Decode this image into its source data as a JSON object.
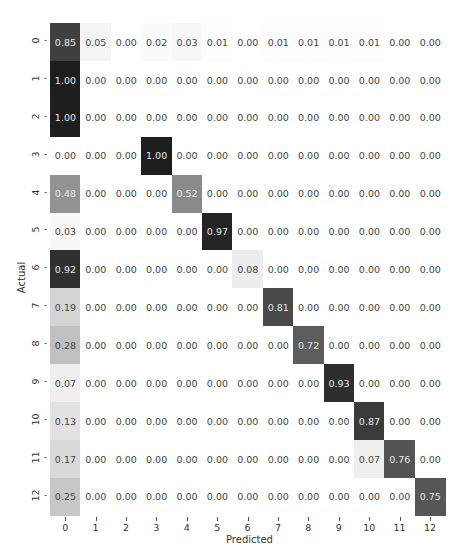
{
  "chart_data": {
    "type": "heatmap",
    "title": "",
    "xlabel": "Predicted",
    "ylabel": "Actual",
    "x_tick_labels": [
      "0",
      "1",
      "2",
      "3",
      "4",
      "5",
      "6",
      "7",
      "8",
      "9",
      "10",
      "11",
      "12"
    ],
    "y_tick_labels": [
      "0",
      "1",
      "2",
      "3",
      "4",
      "5",
      "6",
      "7",
      "8",
      "9",
      "10",
      "11",
      "12"
    ],
    "value_range": [
      0,
      1
    ],
    "colormap": "white-to-black (Greys)",
    "annotation_format": "0.00",
    "colorbar": false,
    "matrix": [
      [
        0.85,
        0.05,
        0.0,
        0.02,
        0.03,
        0.01,
        0.0,
        0.01,
        0.01,
        0.01,
        0.01,
        0.0,
        0.0
      ],
      [
        1.0,
        0.0,
        0.0,
        0.0,
        0.0,
        0.0,
        0.0,
        0.0,
        0.0,
        0.0,
        0.0,
        0.0,
        0.0
      ],
      [
        1.0,
        0.0,
        0.0,
        0.0,
        0.0,
        0.0,
        0.0,
        0.0,
        0.0,
        0.0,
        0.0,
        0.0,
        0.0
      ],
      [
        0.0,
        0.0,
        0.0,
        1.0,
        0.0,
        0.0,
        0.0,
        0.0,
        0.0,
        0.0,
        0.0,
        0.0,
        0.0
      ],
      [
        0.48,
        0.0,
        0.0,
        0.0,
        0.52,
        0.0,
        0.0,
        0.0,
        0.0,
        0.0,
        0.0,
        0.0,
        0.0
      ],
      [
        0.03,
        0.0,
        0.0,
        0.0,
        0.0,
        0.97,
        0.0,
        0.0,
        0.0,
        0.0,
        0.0,
        0.0,
        0.0
      ],
      [
        0.92,
        0.0,
        0.0,
        0.0,
        0.0,
        0.0,
        0.08,
        0.0,
        0.0,
        0.0,
        0.0,
        0.0,
        0.0
      ],
      [
        0.19,
        0.0,
        0.0,
        0.0,
        0.0,
        0.0,
        0.0,
        0.81,
        0.0,
        0.0,
        0.0,
        0.0,
        0.0
      ],
      [
        0.28,
        0.0,
        0.0,
        0.0,
        0.0,
        0.0,
        0.0,
        0.0,
        0.72,
        0.0,
        0.0,
        0.0,
        0.0
      ],
      [
        0.07,
        0.0,
        0.0,
        0.0,
        0.0,
        0.0,
        0.0,
        0.0,
        0.0,
        0.93,
        0.0,
        0.0,
        0.0
      ],
      [
        0.13,
        0.0,
        0.0,
        0.0,
        0.0,
        0.0,
        0.0,
        0.0,
        0.0,
        0.0,
        0.87,
        0.0,
        0.0
      ],
      [
        0.17,
        0.0,
        0.0,
        0.0,
        0.0,
        0.0,
        0.0,
        0.0,
        0.0,
        0.0,
        0.07,
        0.76,
        0.0
      ],
      [
        0.25,
        0.0,
        0.0,
        0.0,
        0.0,
        0.0,
        0.0,
        0.0,
        0.0,
        0.0,
        0.0,
        0.0,
        0.75
      ]
    ],
    "grid": false,
    "legend": "none"
  }
}
